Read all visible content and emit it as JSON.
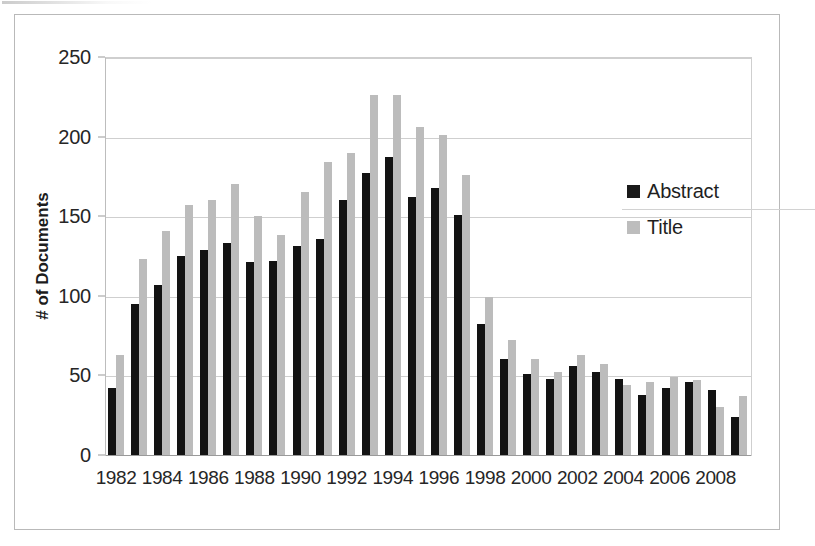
{
  "chart_data": {
    "type": "bar",
    "title": "",
    "xlabel": "",
    "ylabel": "# of Documents",
    "ylim": [
      0,
      250
    ],
    "yticks": [
      0,
      50,
      100,
      150,
      200,
      250
    ],
    "grid": true,
    "legend_position": "right",
    "categories": [
      "1982",
      "1983",
      "1984",
      "1985",
      "1986",
      "1987",
      "1988",
      "1989",
      "1990",
      "1991",
      "1992",
      "1993",
      "1994",
      "1995",
      "1996",
      "1997",
      "1998",
      "1999",
      "2000",
      "2001",
      "2002",
      "2003",
      "2004",
      "2005",
      "2006",
      "2007",
      "2008",
      "2009"
    ],
    "visible_xtick_labels": [
      "1982",
      "1984",
      "1986",
      "1988",
      "1990",
      "1992",
      "1994",
      "1996",
      "1998",
      "2000",
      "2002",
      "2004",
      "2006",
      "2008"
    ],
    "series": [
      {
        "name": "Abstract",
        "color": "#131313",
        "values": [
          42,
          95,
          107,
          125,
          129,
          133,
          121,
          122,
          131,
          136,
          160,
          177,
          187,
          162,
          168,
          151,
          82,
          60,
          51,
          48,
          56,
          52,
          48,
          38,
          42,
          46,
          41,
          24
        ]
      },
      {
        "name": "Title",
        "color": "#bcbcbc",
        "values": [
          63,
          123,
          141,
          157,
          160,
          170,
          150,
          138,
          165,
          184,
          190,
          226,
          226,
          206,
          201,
          176,
          99,
          72,
          60,
          52,
          63,
          57,
          44,
          46,
          49,
          47,
          30,
          37
        ]
      }
    ]
  },
  "legend": {
    "items": [
      {
        "label": "Abstract",
        "swatch": "abstract"
      },
      {
        "label": "Title",
        "swatch": "title"
      }
    ]
  }
}
